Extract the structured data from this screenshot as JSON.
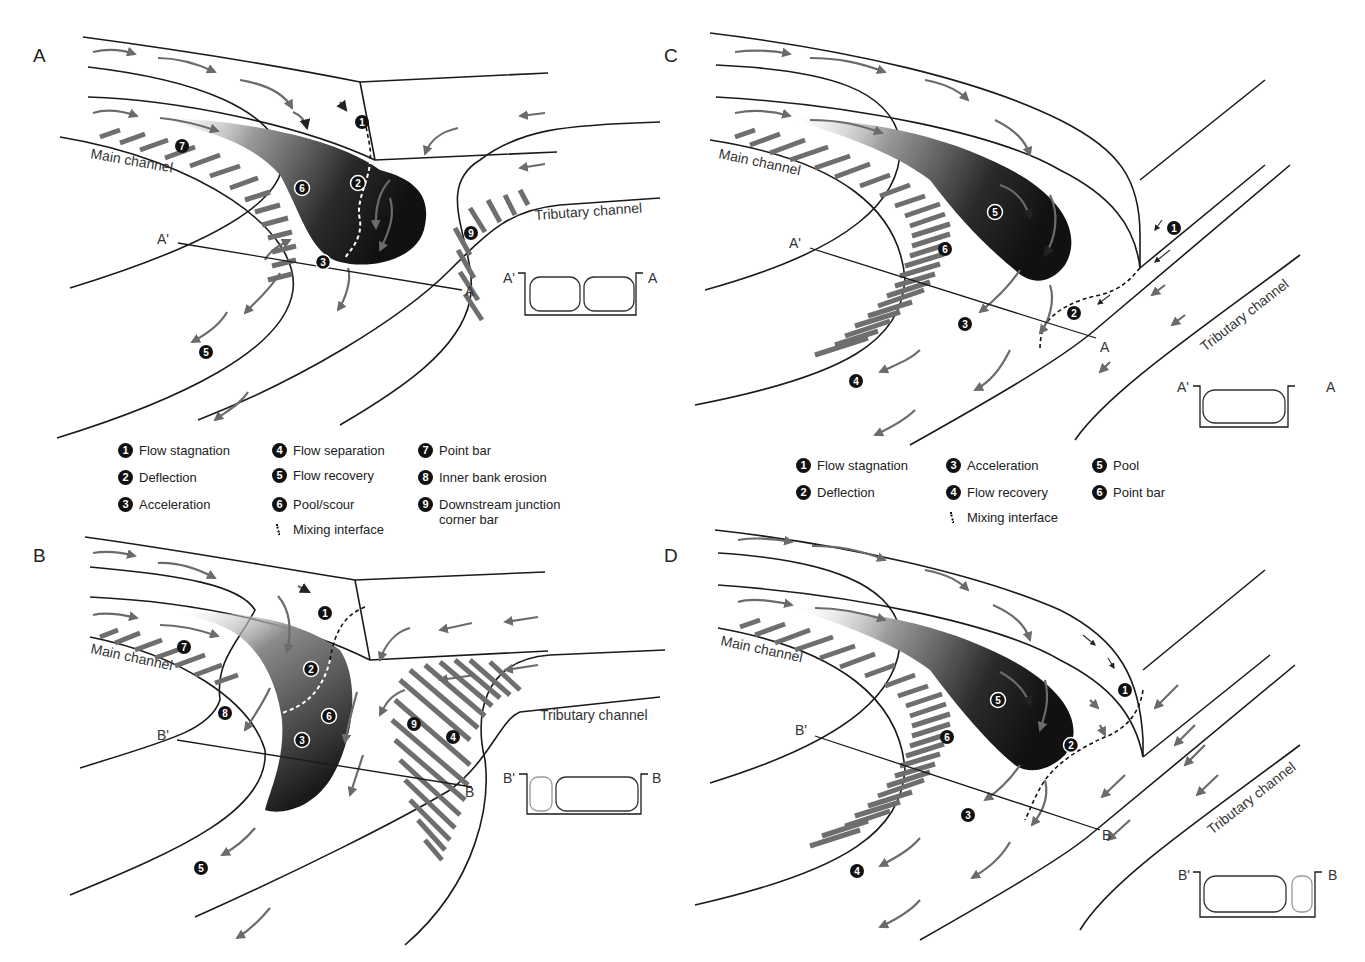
{
  "panels": {
    "A": {
      "label": "A",
      "main_channel_label": "Main channel",
      "tributary_channel_label": "Tributary channel",
      "section": {
        "start": "A'",
        "end": "A"
      },
      "markers": [
        "1",
        "2",
        "3",
        "5",
        "6",
        "7",
        "9"
      ]
    },
    "B": {
      "label": "B",
      "main_channel_label": "Main channel",
      "tributary_channel_label": "Tributary channel",
      "section": {
        "start": "B'",
        "end": "B"
      },
      "markers": [
        "1",
        "2",
        "3",
        "4",
        "5",
        "6",
        "7",
        "8",
        "9"
      ]
    },
    "C": {
      "label": "C",
      "main_channel_label": "Main channel",
      "tributary_channel_label": "Tributary channel",
      "section": {
        "start": "A'",
        "end": "A"
      },
      "markers": [
        "1",
        "2",
        "3",
        "4",
        "5",
        "6"
      ]
    },
    "D": {
      "label": "D",
      "main_channel_label": "Main channel",
      "tributary_channel_label": "Tributary channel",
      "section": {
        "start": "B'",
        "end": "B"
      },
      "markers": [
        "1",
        "2",
        "3",
        "4",
        "5",
        "6"
      ]
    }
  },
  "legend_left": {
    "items": [
      {
        "num": "1",
        "text": "Flow stagnation"
      },
      {
        "num": "2",
        "text": "Deflection"
      },
      {
        "num": "3",
        "text": "Acceleration"
      },
      {
        "num": "4",
        "text": "Flow separation"
      },
      {
        "num": "5",
        "text": "Flow recovery"
      },
      {
        "num": "6",
        "text": "Pool/scour"
      },
      {
        "num": "7",
        "text": "Point bar"
      },
      {
        "num": "8",
        "text": "Inner bank erosion"
      },
      {
        "num": "9",
        "text": "Downstream junction corner bar"
      }
    ],
    "mixing": "Mixing interface"
  },
  "legend_right": {
    "items": [
      {
        "num": "1",
        "text": "Flow stagnation"
      },
      {
        "num": "2",
        "text": "Deflection"
      },
      {
        "num": "3",
        "text": "Acceleration"
      },
      {
        "num": "4",
        "text": "Flow recovery"
      },
      {
        "num": "5",
        "text": "Pool"
      },
      {
        "num": "6",
        "text": "Point bar"
      }
    ],
    "mixing": "Mixing interface"
  },
  "colors": {
    "line": "#1a1a1a",
    "arrow": "#6b6b6b",
    "hatch": "#6e6e6e",
    "pool_dark": "#141414",
    "pool_light": "#d8d8d8"
  }
}
